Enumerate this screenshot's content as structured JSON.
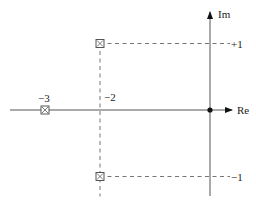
{
  "diagram": {
    "axes": {
      "real_label": "Re",
      "imag_label": "Im"
    },
    "tick_labels": {
      "re_minus3": "−3",
      "re_minus2": "−2",
      "im_plus1": "+1",
      "im_minus1": "−1"
    },
    "origin_marker": "dot",
    "points": [
      {
        "re": -2,
        "im": 1,
        "marker": "boxed-x"
      },
      {
        "re": -3,
        "im": 0,
        "marker": "boxed-x"
      },
      {
        "re": -2,
        "im": -1,
        "marker": "boxed-x"
      }
    ],
    "guides": [
      {
        "from": [
          -2,
          1
        ],
        "to": [
          0,
          1
        ],
        "style": "dashed"
      },
      {
        "from": [
          -2,
          1
        ],
        "to": [
          -2,
          -1.3
        ],
        "style": "dashed"
      },
      {
        "from": [
          -2,
          -1
        ],
        "to": [
          0,
          -1
        ],
        "style": "dashed"
      }
    ]
  }
}
